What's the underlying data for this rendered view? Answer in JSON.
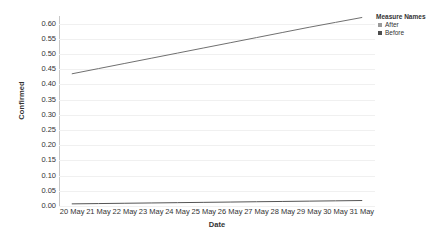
{
  "chart_data": {
    "type": "line",
    "title": "",
    "xlabel": "Date",
    "ylabel": "Confirmed",
    "ylim": [
      0.0,
      0.625
    ],
    "yticks": [
      "0.00",
      "0.05",
      "0.10",
      "0.15",
      "0.20",
      "0.25",
      "0.30",
      "0.35",
      "0.40",
      "0.45",
      "0.50",
      "0.55",
      "0.60"
    ],
    "ytick_values": [
      0.0,
      0.05,
      0.1,
      0.15,
      0.2,
      0.25,
      0.3,
      0.35,
      0.4,
      0.45,
      0.5,
      0.55,
      0.6
    ],
    "grid": true,
    "legend_position": "top-right",
    "categories": [
      "20 May",
      "21 May",
      "22 May",
      "23 May",
      "24 May",
      "25 May",
      "26 May",
      "27 May",
      "28 May",
      "29 May",
      "30 May",
      "31 May"
    ],
    "series": [
      {
        "name": "After",
        "color": "#707070",
        "values": [
          0.435,
          0.452,
          0.469,
          0.486,
          0.503,
          0.52,
          0.537,
          0.554,
          0.571,
          0.588,
          0.604,
          0.62
        ]
      },
      {
        "name": "Before",
        "color": "#555555",
        "values": [
          0.007,
          0.008,
          0.009,
          0.01,
          0.011,
          0.012,
          0.013,
          0.014,
          0.015,
          0.016,
          0.017,
          0.018
        ]
      }
    ]
  },
  "legend": {
    "title": "Measure Names",
    "items": [
      {
        "label": "After",
        "color": "#9a9a9a"
      },
      {
        "label": "Before",
        "color": "#4d4d4d"
      }
    ]
  },
  "axes": {
    "y_title": "Confirmed",
    "x_title": "Date"
  }
}
